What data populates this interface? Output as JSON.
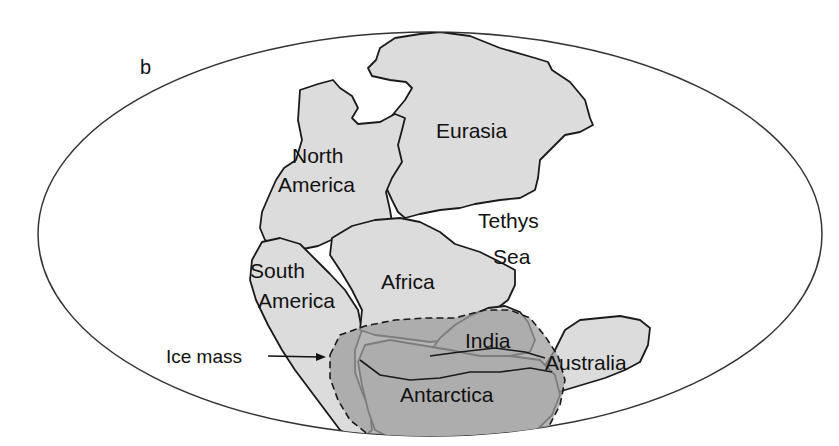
{
  "figure": {
    "panel_label": "b",
    "colors": {
      "background": "#ffffff",
      "outline": "#1a1a1a",
      "land": "#dcdcdc",
      "ice": "#a9a9a9",
      "text": "#111111"
    }
  },
  "labels": {
    "eurasia": "Eurasia",
    "north_america_1": "North",
    "north_america_2": "America",
    "tethys_1": "Tethys",
    "tethys_2": "Sea",
    "south_america_1": "South",
    "south_america_2": "America",
    "africa": "Africa",
    "india": "India",
    "australia": "Australia",
    "antarctica": "Antarctica",
    "ice_mass": "Ice mass"
  }
}
